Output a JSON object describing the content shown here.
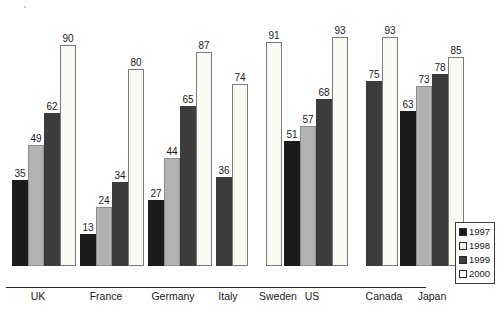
{
  "chart_data": {
    "type": "bar",
    "title": "",
    "subtitle": "",
    "xlabel": "",
    "ylabel": "",
    "ylim": [
      0,
      100
    ],
    "grid": false,
    "legend_position": "bottom-right",
    "categories": [
      "UK",
      "France",
      "Germany",
      "Italy",
      "Sweden",
      "US",
      "Canada",
      "Japan"
    ],
    "series": [
      {
        "name": "1997",
        "color": "#1b1b1b",
        "values": [
          35,
          13,
          27,
          null,
          null,
          51,
          null,
          63
        ]
      },
      {
        "name": "1998",
        "color": "#b3b3b3",
        "values": [
          49,
          24,
          44,
          null,
          null,
          57,
          null,
          73
        ]
      },
      {
        "name": "1999",
        "color": "#3c3c3c",
        "values": [
          62,
          34,
          65,
          36,
          null,
          68,
          75,
          78
        ]
      },
      {
        "name": "2000",
        "color": "#fbfbf6",
        "values": [
          90,
          80,
          87,
          74,
          91,
          93,
          93,
          85
        ]
      }
    ],
    "groups": [
      {
        "label": "UK",
        "left": 12,
        "label_left": 8,
        "label_width": 60,
        "bars": [
          {
            "series": "1997",
            "value": 35,
            "label": "35"
          },
          {
            "series": "1998",
            "value": 49,
            "label": "49"
          },
          {
            "series": "1999",
            "value": 62,
            "label": "62"
          },
          {
            "series": "2000",
            "value": 90,
            "label": "90"
          }
        ]
      },
      {
        "label": "France",
        "left": 80,
        "label_left": 76,
        "label_width": 60,
        "bars": [
          {
            "series": "1997",
            "value": 13,
            "label": "13"
          },
          {
            "series": "1998",
            "value": 24,
            "label": "24"
          },
          {
            "series": "1999",
            "value": 34,
            "label": "34"
          },
          {
            "series": "2000",
            "value": 80,
            "label": "80"
          }
        ]
      },
      {
        "label": "Germany",
        "left": 148,
        "label_left": 142,
        "label_width": 62,
        "bars": [
          {
            "series": "1997",
            "value": 27,
            "label": "27"
          },
          {
            "series": "1998",
            "value": 44,
            "label": "44"
          },
          {
            "series": "1999",
            "value": 65,
            "label": "65"
          },
          {
            "series": "2000",
            "value": 87,
            "label": "87"
          }
        ]
      },
      {
        "label": "Italy",
        "left": 216,
        "label_left": 204,
        "label_width": 48,
        "bars": [
          {
            "series": "1999",
            "value": 36,
            "label": "36"
          },
          {
            "series": "2000",
            "value": 74,
            "label": "74"
          }
        ]
      },
      {
        "label": "Sweden",
        "left": 266,
        "label_left": 252,
        "label_width": 52,
        "bars": [
          {
            "series": "2000",
            "value": 91,
            "label": "91"
          }
        ]
      },
      {
        "label": "US",
        "left": 284,
        "label_left": 292,
        "label_width": 40,
        "bars": [
          {
            "series": "1997",
            "value": 51,
            "label": "51"
          },
          {
            "series": "1998",
            "value": 57,
            "label": "57"
          },
          {
            "series": "1999",
            "value": 68,
            "label": "68"
          },
          {
            "series": "2000",
            "value": 93,
            "label": "93"
          }
        ]
      },
      {
        "label": "Canada",
        "left": 366,
        "label_left": 358,
        "label_width": 52,
        "bars": [
          {
            "series": "1999",
            "value": 75,
            "label": "75"
          },
          {
            "series": "2000",
            "value": 93,
            "label": "93"
          }
        ]
      },
      {
        "label": "Japan",
        "left": 400,
        "label_left": 406,
        "label_width": 52,
        "bars": [
          {
            "series": "1997",
            "value": 63,
            "label": "63"
          },
          {
            "series": "1998",
            "value": 73,
            "label": "73"
          },
          {
            "series": "1999",
            "value": 78,
            "label": "78"
          },
          {
            "series": "2000",
            "value": 85,
            "label": "85"
          }
        ]
      }
    ]
  },
  "legend": {
    "items": [
      {
        "label": "1997",
        "swatch": "c1997"
      },
      {
        "label": "1998",
        "swatch": "c1998"
      },
      {
        "label": "1999",
        "swatch": "c1999"
      },
      {
        "label": "2000",
        "swatch": "c2000"
      }
    ]
  },
  "footnote": {
    "text": ""
  }
}
